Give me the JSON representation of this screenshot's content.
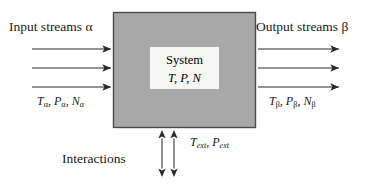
{
  "figure": {
    "type": "block-flow-diagram",
    "colors": {
      "box_fill": "#a8a8a8",
      "box_border": "#4a4a4a",
      "inner_fill": "#f7f7f5",
      "arrow": "#2b2b2b",
      "text": "#1a1a1a",
      "background": "#ffffff"
    }
  },
  "labels": {
    "input_streams": "Input streams α",
    "output_streams": "Output streams β",
    "interactions": "Interactions"
  },
  "system": {
    "title": "System",
    "state_variables": "T,  P,  N"
  },
  "variables": {
    "inlet": {
      "T": "T",
      "P": "P",
      "N": "N",
      "subscript": "α",
      "text": "Tα, Pα, Nα"
    },
    "outlet": {
      "T": "T",
      "P": "P",
      "N": "N",
      "subscript": "β",
      "text": "Tβ, Pβ, Nβ"
    },
    "external": {
      "T": "T",
      "P": "P",
      "subscript": "ext",
      "text": "Text, Pext"
    }
  },
  "arrows": {
    "inlet_streams": {
      "count": 3,
      "direction": "right",
      "x_start": 32,
      "x_end": 113,
      "y_positions": [
        49,
        68,
        87
      ]
    },
    "outlet_streams": {
      "count": 3,
      "direction": "right",
      "x_start": 256,
      "x_end": 341,
      "y_positions": [
        49,
        68,
        87
      ]
    },
    "interaction_arrows": {
      "count": 2,
      "direction": "double-vertical",
      "x_positions": [
        162,
        174
      ],
      "y_start": 130,
      "y_end": 177
    }
  },
  "system_box": {
    "x": 113,
    "y": 12,
    "width": 143,
    "height": 116
  }
}
